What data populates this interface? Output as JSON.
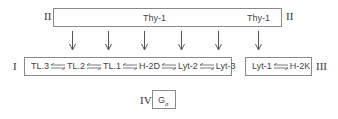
{
  "diagram": {
    "groups": [
      {
        "id": "II",
        "roman_left": "II",
        "roman_right": "II",
        "labels": [
          "Thy-1",
          "Thy-1"
        ]
      },
      {
        "id": "I",
        "roman": "I",
        "chain": [
          "TL.3",
          "TL.2",
          "TL.1",
          "H-2D",
          "Lyt-2",
          "Lyt-3"
        ]
      },
      {
        "id": "III",
        "roman": "III",
        "chain": [
          "Lyt-1",
          "H-2K"
        ]
      },
      {
        "id": "IV",
        "roman": "IV",
        "label_main": "G",
        "label_sub": "α"
      }
    ],
    "connector": "double-arrow (⇄)",
    "down_arrows_count": 6,
    "colors": {
      "line": "#8a8a8a",
      "text": "#444444"
    }
  }
}
